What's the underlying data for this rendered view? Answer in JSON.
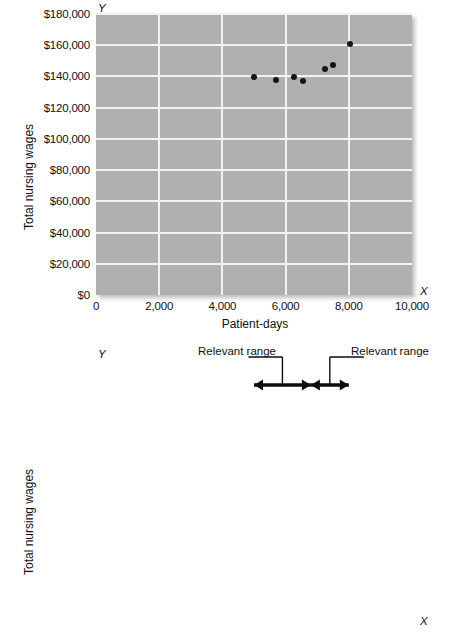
{
  "chart_data": [
    {
      "id": "scatter",
      "type": "scatter",
      "title": "",
      "xlabel": "Patient-days",
      "ylabel": "Total nursing wages",
      "x_axis_letter": "X",
      "y_axis_letter": "Y",
      "xlim": [
        0,
        10000
      ],
      "ylim": [
        0,
        180000
      ],
      "grid": true,
      "legend": "none",
      "xticks": [
        "0",
        "2,000",
        "4,000",
        "6,000",
        "8,000",
        "10,000"
      ],
      "xtick_values": [
        0,
        2000,
        4000,
        6000,
        8000,
        10000
      ],
      "yticks": [
        "$0",
        "$20,000",
        "$40,000",
        "$60,000",
        "$80,000",
        "$100,000",
        "$120,000",
        "$140,000",
        "$160,000",
        "$180,000"
      ],
      "ytick_values": [
        0,
        20000,
        40000,
        60000,
        80000,
        100000,
        120000,
        140000,
        160000,
        180000
      ],
      "points": [
        {
          "x": 5000,
          "y": 139500
        },
        {
          "x": 5700,
          "y": 138000
        },
        {
          "x": 6250,
          "y": 139500
        },
        {
          "x": 6550,
          "y": 137000
        },
        {
          "x": 7250,
          "y": 145000
        },
        {
          "x": 7500,
          "y": 147500
        },
        {
          "x": 8050,
          "y": 161000
        }
      ]
    },
    {
      "id": "step-cost",
      "type": "line",
      "title": "",
      "xlabel": "",
      "ylabel": "Total nursing wages",
      "x_axis_letter": "X",
      "y_axis_letter": "Y",
      "xlim": [
        0,
        10000
      ],
      "ylim": [
        0,
        180000
      ],
      "grid": true,
      "legend": "none",
      "xticks": [],
      "xtick_values": [
        0,
        2000,
        4000,
        6000,
        8000,
        10000
      ],
      "yticks": [
        "$0",
        "$20,000",
        "$40,000",
        "$60,000",
        "$80,000",
        "$100,000",
        "$120,000",
        "$140,000",
        "$160,000",
        "$180,000"
      ],
      "ytick_values": [
        0,
        20000,
        40000,
        60000,
        80000,
        100000,
        120000,
        140000,
        160000,
        180000
      ],
      "points": [
        {
          "x": 5000,
          "y": 139500
        },
        {
          "x": 5700,
          "y": 138000
        },
        {
          "x": 6250,
          "y": 139500
        },
        {
          "x": 6550,
          "y": 137000
        },
        {
          "x": 7250,
          "y": 145000
        },
        {
          "x": 7500,
          "y": 147500
        },
        {
          "x": 8050,
          "y": 161000
        }
      ],
      "line": {
        "label": "cost-function-line",
        "vertices": [
          {
            "x": 0,
            "y": 140000
          },
          {
            "x": 6650,
            "y": 140000
          },
          {
            "x": 10000,
            "y": 161500
          }
        ]
      },
      "bands": [
        {
          "label": "relevant-range-band-1",
          "x_start": 5000,
          "x_end": 6800,
          "shade": "#d9d9d9"
        },
        {
          "label": "relevant-range-band-2",
          "x_start": 6800,
          "x_end": 8000,
          "shade": "#f7f7f7"
        }
      ],
      "annotations": [
        {
          "label": "Relevant range",
          "target_x": 5900,
          "arrow_from": 5000,
          "arrow_to": 6800
        },
        {
          "label": "Relevant range",
          "target_x": 7400,
          "arrow_from": 6800,
          "arrow_to": 8000
        }
      ]
    }
  ],
  "figures": {
    "top": {
      "y_axis_title": "Total nursing wages",
      "x_axis_title": "Patient-days",
      "x_letter": "X",
      "y_letter": "Y"
    },
    "bottom": {
      "y_axis_title": "Total nursing wages",
      "x_axis_title": "",
      "x_letter": "X",
      "y_letter": "Y",
      "annotation_left": "Relevant range",
      "annotation_right": "Relevant range"
    }
  }
}
